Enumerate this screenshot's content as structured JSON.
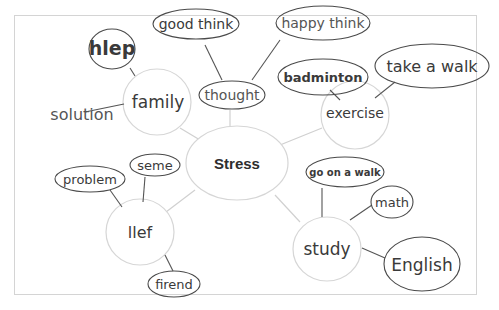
{
  "diagram": {
    "type": "mind-map",
    "center": {
      "label": "Stress"
    },
    "branches": [
      {
        "label": "family",
        "children": [
          {
            "label": "hlep"
          },
          {
            "label": "solution"
          }
        ]
      },
      {
        "label": "thought",
        "children": [
          {
            "label": "good think"
          },
          {
            "label": "happy think"
          }
        ]
      },
      {
        "label": "exercise",
        "children": [
          {
            "label": "badminton"
          },
          {
            "label": "take a walk"
          }
        ]
      },
      {
        "label": "study",
        "children": [
          {
            "label": "go on a walk"
          },
          {
            "label": "math"
          },
          {
            "label": "English"
          }
        ]
      },
      {
        "label": "llef",
        "children": [
          {
            "label": "problem"
          },
          {
            "label": "seme"
          },
          {
            "label": "firend"
          }
        ]
      }
    ]
  },
  "colors": {
    "background": "#ffffff",
    "frame": "#d4d4d4",
    "light_line": "#cfcfcf",
    "pencil": "#3a3a3a",
    "pencil_light": "#6a6a6a"
  }
}
